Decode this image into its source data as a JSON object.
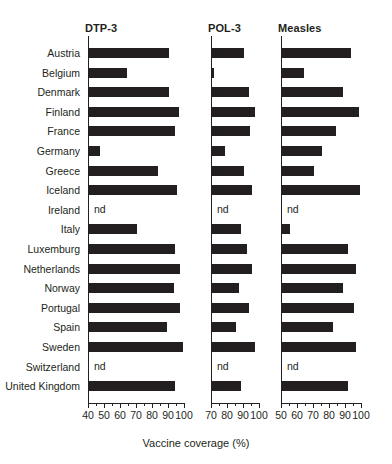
{
  "chart_data": {
    "type": "bar",
    "orientation": "horizontal",
    "title": "",
    "xlabel": "Vaccine coverage (%)",
    "ylabel": "",
    "grid": false,
    "legend": null,
    "no_data_marker": "nd",
    "bar_color": "#231f20",
    "categories": [
      "Austria",
      "Belgium",
      "Denmark",
      "Finland",
      "France",
      "Germany",
      "Greece",
      "Iceland",
      "Ireland",
      "Italy",
      "Luxemburg",
      "Netherlands",
      "Norway",
      "Portugal",
      "Spain",
      "Sweden",
      "Switzerland",
      "United Kingdom"
    ],
    "panels": [
      {
        "name": "DTP-3",
        "label": "DTP-3",
        "xlim": [
          40,
          100
        ],
        "major_ticks": [
          40,
          50,
          60,
          70,
          80,
          90,
          100
        ],
        "minor_ticks": [
          45,
          55,
          65,
          75,
          85,
          95
        ],
        "tick_labels": [
          "40",
          "50",
          "60",
          "70",
          "80",
          "90",
          "100"
        ],
        "values": [
          90,
          64,
          90,
          96,
          94,
          47,
          83,
          95,
          null,
          70,
          94,
          97,
          93,
          97,
          89,
          99,
          null,
          94
        ]
      },
      {
        "name": "POL-3",
        "label": "POL-3",
        "xlim": [
          70,
          100
        ],
        "major_ticks": [
          70,
          80,
          90,
          100
        ],
        "minor_ticks": [
          75,
          85,
          95
        ],
        "tick_labels": [
          "70",
          "80",
          "90",
          "100"
        ],
        "values": [
          90,
          71,
          93,
          97,
          94,
          78,
          90,
          95,
          null,
          88,
          92,
          95,
          87,
          93,
          85,
          97,
          null,
          88
        ]
      },
      {
        "name": "Measles",
        "label": "Measles",
        "xlim": [
          50,
          100
        ],
        "major_ticks": [
          50,
          60,
          70,
          80,
          90,
          100
        ],
        "minor_ticks": [
          55,
          65,
          75,
          85,
          95
        ],
        "tick_labels": [
          "50",
          "60",
          "70",
          "80",
          "90",
          "100"
        ],
        "values": [
          93,
          64,
          88,
          98,
          84,
          75,
          70,
          99,
          null,
          55,
          91,
          96,
          88,
          95,
          82,
          96,
          null,
          91
        ]
      }
    ]
  }
}
